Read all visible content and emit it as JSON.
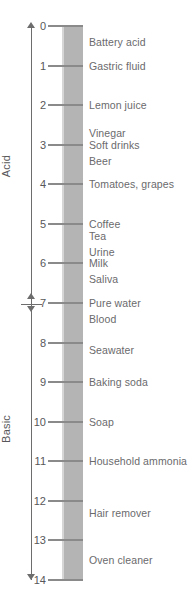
{
  "chart_data": {
    "type": "scatter",
    "ylabel": "pH",
    "ylim": [
      0,
      14
    ],
    "axis_ticks": [
      0,
      1,
      2,
      3,
      4,
      5,
      6,
      7,
      8,
      9,
      10,
      11,
      12,
      13,
      14
    ],
    "grid": false,
    "legend": "none",
    "regions": [
      {
        "name": "Acid",
        "range": [
          0,
          7
        ]
      },
      {
        "name": "Basic",
        "range": [
          7,
          14
        ]
      }
    ],
    "neutral_point": 7,
    "categories": [
      "Battery acid",
      "Gastric fluid",
      "Lemon juice",
      "Vinegar",
      "Soft drinks",
      "Beer",
      "Tomatoes, grapes",
      "Coffee",
      "Tea",
      "Urine",
      "Milk",
      "Saliva",
      "Pure water",
      "Blood",
      "Seawater",
      "Baking soda",
      "Soap",
      "Household ammonia",
      "Hair remover",
      "Oven cleaner"
    ],
    "values": [
      0.4,
      1.0,
      2.0,
      2.7,
      3.0,
      3.4,
      4.0,
      5.0,
      5.3,
      5.7,
      6.0,
      6.4,
      7.0,
      7.4,
      8.2,
      9.0,
      10.0,
      11.0,
      12.3,
      13.5
    ],
    "points": [
      {
        "label": "Battery acid",
        "ph": 0.4
      },
      {
        "label": "Gastric fluid",
        "ph": 1.0
      },
      {
        "label": "Lemon juice",
        "ph": 2.0
      },
      {
        "label": "Vinegar",
        "ph": 2.7
      },
      {
        "label": "Soft drinks",
        "ph": 3.0
      },
      {
        "label": "Beer",
        "ph": 3.4
      },
      {
        "label": "Tomatoes, grapes",
        "ph": 4.0
      },
      {
        "label": "Coffee",
        "ph": 5.0
      },
      {
        "label": "Tea",
        "ph": 5.3
      },
      {
        "label": "Urine",
        "ph": 5.7
      },
      {
        "label": "Milk",
        "ph": 6.0
      },
      {
        "label": "Saliva",
        "ph": 6.4
      },
      {
        "label": "Pure water",
        "ph": 7.0
      },
      {
        "label": "Blood",
        "ph": 7.4
      },
      {
        "label": "Seawater",
        "ph": 8.2
      },
      {
        "label": "Baking soda",
        "ph": 9.0
      },
      {
        "label": "Soap",
        "ph": 10.0
      },
      {
        "label": "Household ammonia",
        "ph": 11.0
      },
      {
        "label": "Hair remover",
        "ph": 12.3
      },
      {
        "label": "Oven cleaner",
        "ph": 13.5
      }
    ]
  },
  "colors": {
    "column": "#b4b4b4",
    "column_highlight": "#d6d6d6",
    "axis": "#6d6d6d",
    "tick": "#8a8a8a",
    "text": "#58585a",
    "label_text": "#6a6a6c",
    "background": "#ffffff"
  }
}
